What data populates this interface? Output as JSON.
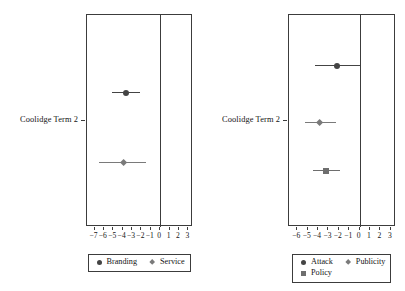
{
  "figure": {
    "background_color": "#ffffff",
    "axis_color": "#3c3c3c",
    "text_color": "#141414"
  },
  "chart_data": [
    {
      "type": "scatter",
      "panel_id": "left",
      "title": "",
      "xlabel": "",
      "ylabel": "",
      "categories": [
        "Coolidge Term 2"
      ],
      "xlim": [
        -7.8,
        3.5
      ],
      "xticks": [
        -7,
        -6,
        -5,
        -4,
        -3,
        -2,
        -1,
        0,
        1,
        2,
        3
      ],
      "xticklabels": [
        "−7",
        "−6",
        "−5",
        "−4",
        "−3",
        "−2",
        "−1",
        "0",
        "1",
        "2",
        "3"
      ],
      "grid": false,
      "reference_line": 0,
      "legend_position": "bottom",
      "series": [
        {
          "name": "Branding",
          "marker": "circle",
          "color": "#444444",
          "estimate": -3.6,
          "ci_low": -5.1,
          "ci_high": -2.1
        },
        {
          "name": "Service",
          "marker": "diamond",
          "color": "#7a7a7a",
          "estimate": -3.9,
          "ci_low": -6.5,
          "ci_high": -1.5
        }
      ]
    },
    {
      "type": "scatter",
      "panel_id": "right",
      "title": "",
      "xlabel": "",
      "ylabel": "",
      "categories": [
        "Coolidge Term 2"
      ],
      "xlim": [
        -6.8,
        3.5
      ],
      "xticks": [
        -6,
        -5,
        -4,
        -3,
        -2,
        -1,
        0,
        1,
        2,
        3
      ],
      "xticklabels": [
        "−6",
        "−5",
        "−4",
        "−3",
        "−2",
        "−1",
        "0",
        "1",
        "2",
        "3"
      ],
      "grid": false,
      "reference_line": 0,
      "legend_position": "bottom",
      "series": [
        {
          "name": "Attack",
          "marker": "circle",
          "color": "#444444",
          "estimate": -2.2,
          "ci_low": -4.3,
          "ci_high": 0.0
        },
        {
          "name": "Publicity",
          "marker": "diamond",
          "color": "#7a7a7a",
          "estimate": -3.9,
          "ci_low": -5.3,
          "ci_high": -2.3
        },
        {
          "name": "Policy",
          "marker": "square",
          "color": "#6e6e6e",
          "estimate": -3.2,
          "ci_low": -4.5,
          "ci_high": -1.9
        }
      ]
    }
  ]
}
